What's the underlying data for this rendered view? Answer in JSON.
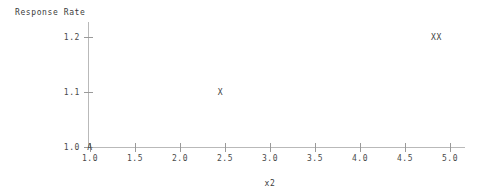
{
  "chart_data": {
    "type": "scatter",
    "title": "",
    "ylabel": "Response Rate",
    "xlabel": "x2",
    "xlim": [
      0.9,
      5.15
    ],
    "ylim": [
      0.975,
      1.235
    ],
    "grid": false,
    "legend": null,
    "xticks": [
      "1.0",
      "1.5",
      "2.0",
      "2.5",
      "3.0",
      "3.5",
      "4.0",
      "4.5",
      "5.0"
    ],
    "xtick_values": [
      1.0,
      1.5,
      2.0,
      2.5,
      3.0,
      3.5,
      4.0,
      4.5,
      5.0
    ],
    "yticks": [
      "1.0",
      "1.1",
      "1.2"
    ],
    "ytick_values": [
      1.0,
      1.1,
      1.2
    ],
    "points": [
      {
        "label": "A",
        "x": 1.0,
        "y": 1.0
      },
      {
        "label": "X",
        "x": 2.45,
        "y": 1.1
      },
      {
        "label": "XX",
        "x": 4.85,
        "y": 1.2
      }
    ],
    "axis_color": "#b9b9b9",
    "tick_color": "#9a9a9a",
    "text_color": "#3c3c3c"
  }
}
